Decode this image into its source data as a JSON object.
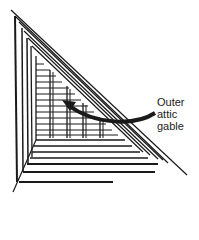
{
  "diagram": {
    "label_lines": [
      "Outer",
      "attic",
      "gable"
    ],
    "colors": {
      "line": "#1a1a1a",
      "background": "#ffffff"
    }
  }
}
